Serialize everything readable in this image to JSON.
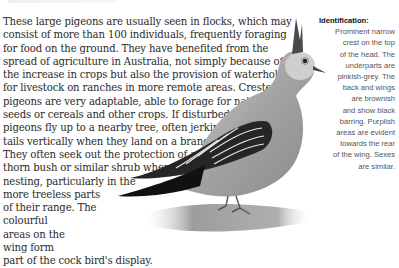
{
  "article": {
    "body_lines": [
      "These large pigeons are usually seen in flocks, which may",
      "consist of more than 100 individuals, frequently foraging",
      "for food on the ground. They have benefited from the",
      "spread of agriculture in Australia, not simply because of",
      "the increase in crops but also the provision of waterholes",
      "for livestock on ranches in more remote areas. Crested",
      "pigeons are very adaptable, able to forage for native",
      "seeds or cereals and other crops. If disturbed, these",
      "pigeons fly up to a nearby tree, often jerking their",
      "tails vertically when they land on a branch.",
      "They often seek out the protection of a",
      "thorn bush or similar shrub when",
      "nesting, particularly in the",
      "more treeless parts",
      "of their range. The",
      "colourful",
      "areas on the",
      "wing form",
      "part of the cock bird's display."
    ]
  },
  "identification": {
    "heading": "Identification:",
    "lines": [
      "Prominent narrow",
      "crest on the top",
      "of the head. The",
      "underparts are",
      "pinkish-grey. The",
      "back and wings",
      "are brownish",
      "and show black",
      "barring. Purplish",
      "areas are evident",
      "towards the rear",
      "of the wing. Sexes",
      "are similar."
    ]
  },
  "illustration": {
    "subject": "crested-pigeon",
    "colors": {
      "body": "#9a9a9a",
      "head": "#cfcfcf",
      "wing_dark": "#1e1e1e",
      "wing_bar": "#e8e8e8",
      "ground": "#a8a8a8"
    }
  }
}
